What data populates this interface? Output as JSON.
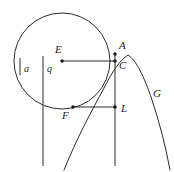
{
  "figure": {
    "type": "geometry-diagram",
    "stroke_color": "#2b2b2b",
    "label_color": "#1a1a1a",
    "background": "#ffffff"
  },
  "labels": {
    "a": "a",
    "q": "q",
    "E": "E",
    "A": "A",
    "C": "C",
    "G": "G",
    "F": "F",
    "L": "L"
  },
  "shapes": {
    "circle": {
      "cx": 62,
      "cy": 61,
      "r": 48
    },
    "parabola": {
      "vertex_x": 128,
      "vertex_y": 55,
      "opens": "down"
    },
    "vertical_line_q": {
      "x": 43,
      "y1": 56,
      "y2": 166
    },
    "vertical_line_right": {
      "x": 115,
      "y1": 54,
      "y2": 166
    },
    "tick_a": {
      "x": 20,
      "y1": 58,
      "y2": 75
    }
  },
  "points": [
    {
      "name": "E",
      "x": 62,
      "y": 61
    },
    {
      "name": "A",
      "x": 115,
      "y": 54
    },
    {
      "name": "C",
      "x": 115,
      "y": 61
    },
    {
      "name": "F",
      "x": 73,
      "y": 107
    },
    {
      "name": "L",
      "x": 115,
      "y": 107
    }
  ],
  "segments": [
    {
      "name": "E-to-C",
      "x1": 62,
      "y1": 61,
      "x2": 115,
      "y2": 61
    },
    {
      "name": "F-to-L",
      "x1": 73,
      "y1": 107,
      "x2": 115,
      "y2": 107
    }
  ]
}
